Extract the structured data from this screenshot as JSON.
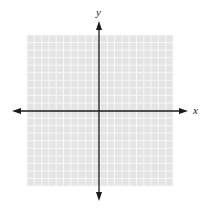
{
  "diagram": {
    "type": "coordinate-plane",
    "axes": {
      "x_label": "x",
      "y_label": "y"
    },
    "grid": {
      "cells_x": 20,
      "cells_y": 20,
      "left": 27,
      "top": 35,
      "right": 173,
      "bottom": 186,
      "background_color": "#e4e4e4",
      "line_color": "#f7f7f7"
    },
    "origin": {
      "x": 99,
      "y": 111
    },
    "arrows": {
      "left_tip": 12,
      "right_tip": 188,
      "top_tip": 21,
      "bottom_tip": 201
    },
    "colors": {
      "axis": "#1a1a1a",
      "label": "#222222"
    }
  }
}
